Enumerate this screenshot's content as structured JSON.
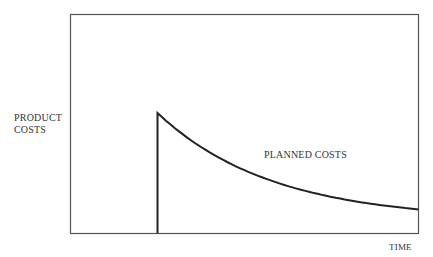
{
  "chart_data": {
    "type": "line",
    "title": "",
    "xlabel": "TIME",
    "ylabel": [
      "PRODUCT",
      "COSTS"
    ],
    "grid": false,
    "legend": "none",
    "annotations": [
      "PLANNED COSTS"
    ],
    "series": [
      {
        "name": "PLANNED COSTS",
        "description": "Step up at product start, then exponential decay of cost over time",
        "x": [
          0.0,
          0.25,
          0.25,
          0.35,
          0.5,
          0.65,
          0.8,
          1.0
        ],
        "y": [
          0.0,
          0.0,
          0.55,
          0.41,
          0.29,
          0.2,
          0.14,
          0.11
        ]
      }
    ],
    "xlim": [
      0,
      1
    ],
    "ylim": [
      0,
      1
    ],
    "axis_ticks": false
  },
  "labels": {
    "y_line1": "PRODUCT",
    "y_line2": "COSTS",
    "series": "PLANNED COSTS",
    "x": "TIME"
  },
  "colors": {
    "frame": "#555555",
    "curve": "#222222",
    "text": "#333333"
  }
}
